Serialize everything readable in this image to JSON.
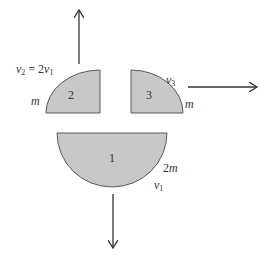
{
  "diagram": {
    "title": "",
    "colors": {
      "fill": "#c8c8c8",
      "stroke": "#5a5a5a",
      "arrow": "#333333",
      "text": "#333333"
    },
    "fragments": [
      {
        "id": "2",
        "label": "2",
        "shape": "quarter-circle",
        "mass_label": "m",
        "velocity_label": "v",
        "velocity_subscript": "2",
        "velocity_relation": "= 2",
        "velocity_relation_var": "v",
        "velocity_relation_subscript": "1",
        "direction": "up"
      },
      {
        "id": "3",
        "label": "3",
        "shape": "quarter-circle",
        "mass_label": "m",
        "velocity_label": "v",
        "velocity_subscript": "3",
        "direction": "right"
      },
      {
        "id": "1",
        "label": "1",
        "shape": "semicircle",
        "mass_label": "2m",
        "velocity_label": "v",
        "velocity_subscript": "1",
        "direction": "down"
      }
    ]
  }
}
